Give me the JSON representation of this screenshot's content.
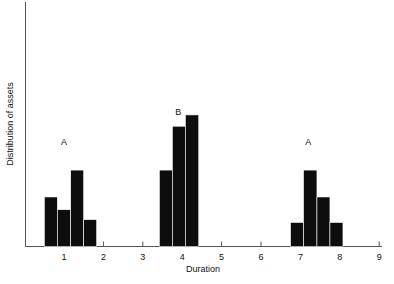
{
  "chart_data": {
    "type": "bar",
    "title": "",
    "subtitle": "",
    "xlabel": "Duration",
    "ylabel": "Distribution of assets",
    "xlim": [
      0.42,
      9.3
    ],
    "ylim": [
      0,
      1
    ],
    "grid": false,
    "legend": null,
    "xticks": [
      1,
      2,
      3,
      4,
      5,
      6,
      7,
      8,
      9
    ],
    "xtick_labels": [
      "1",
      "2",
      "3",
      "4",
      "5",
      "6",
      "7",
      "8",
      "9"
    ],
    "yticks": [],
    "ytick_labels": [],
    "bin_width": 0.33,
    "bar_color": "#0d0d0d",
    "axis_color": "#555555",
    "annotations": [
      {
        "text": "A",
        "x": 1.0,
        "y": 0.72
      },
      {
        "text": "B",
        "x": 3.9,
        "y": 0.93
      },
      {
        "text": "A",
        "x": 7.2,
        "y": 0.72
      }
    ],
    "groups": [
      {
        "label": "A",
        "bars": [
          {
            "x0": 0.5,
            "x1": 0.83,
            "value": 0.35
          },
          {
            "x0": 0.83,
            "x1": 1.17,
            "value": 0.26
          },
          {
            "x0": 1.17,
            "x1": 1.5,
            "value": 0.54
          },
          {
            "x0": 1.5,
            "x1": 1.83,
            "value": 0.19
          }
        ]
      },
      {
        "label": "B",
        "bars": [
          {
            "x0": 3.42,
            "x1": 3.75,
            "value": 0.54
          },
          {
            "x0": 3.75,
            "x1": 4.08,
            "value": 0.85
          },
          {
            "x0": 4.08,
            "x1": 4.42,
            "value": 0.93
          }
        ]
      },
      {
        "label": "A",
        "bars": [
          {
            "x0": 6.75,
            "x1": 7.08,
            "value": 0.17
          },
          {
            "x0": 7.08,
            "x1": 7.42,
            "value": 0.54
          },
          {
            "x0": 7.42,
            "x1": 7.75,
            "value": 0.35
          },
          {
            "x0": 7.75,
            "x1": 8.08,
            "value": 0.17
          }
        ]
      }
    ]
  }
}
